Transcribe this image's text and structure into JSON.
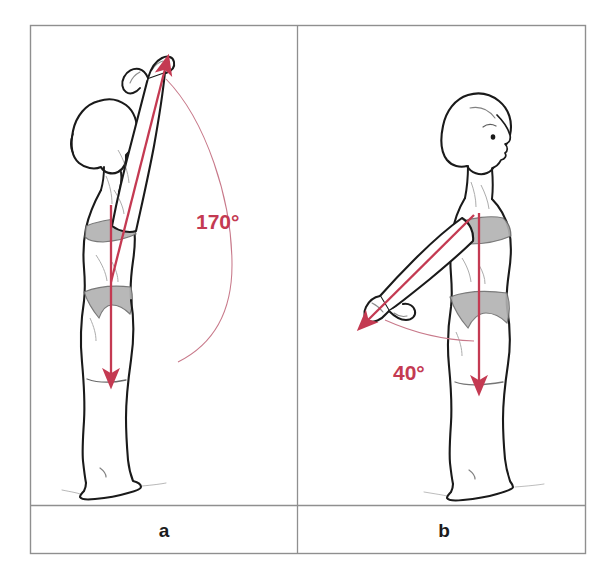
{
  "figure": {
    "frame": {
      "border_color": "#8c8c8c",
      "background_color": "#ffffff"
    },
    "accent_color": "#c43a52",
    "arc_color": "#c8798a",
    "outline_color": "#1a1a1a",
    "shading_color": "#a9a9a9",
    "panels": [
      {
        "id": "panel-a",
        "caption": "a",
        "angle_label": "170°",
        "angle_value": 170,
        "description": "Side view of a standing figure with one arm raised fully overhead; a red arrow runs along the raised arm and a red arrow runs down the trunk; a thin arc spans between them.",
        "arrow_up_name": "arm-direction-arrow",
        "arrow_down_name": "trunk-reference-arrow",
        "arc_name": "angle-arc"
      },
      {
        "id": "panel-b",
        "caption": "b",
        "angle_label": "40°",
        "angle_value": 40,
        "description": "Side view of a standing figure with one arm extended backward and downward; a red arrow runs along the extended arm and a red arrow runs down the trunk; a thin arc spans between them.",
        "arrow_up_name": "arm-direction-arrow",
        "arrow_down_name": "trunk-reference-arrow",
        "arc_name": "angle-arc"
      }
    ]
  }
}
